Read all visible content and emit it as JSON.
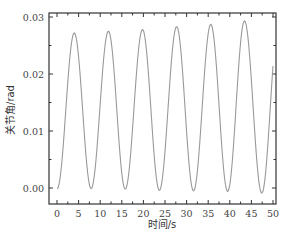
{
  "chart_data": {
    "type": "line",
    "title": "",
    "xlabel": "时间/s",
    "ylabel": "关节角/rad",
    "xlim": [
      -2,
      52
    ],
    "ylim": [
      -0.0028,
      0.0312
    ],
    "xticks": [
      0,
      5,
      10,
      15,
      20,
      25,
      30,
      35,
      40,
      45,
      50
    ],
    "xtick_labels": [
      "0",
      "5",
      "10",
      "15",
      "20",
      "25",
      "30",
      "35",
      "40",
      "45",
      "50"
    ],
    "yticks": [
      0.0,
      0.01,
      0.02,
      0.03
    ],
    "ytick_labels": [
      "0.00",
      "0.01",
      "0.02",
      "0.03"
    ],
    "grid": false,
    "legend": null,
    "line_color": "#999999",
    "series": [
      {
        "name": "关节角",
        "description": "sinusoidal oscillation with slowly growing amplitude, period ~7.8 s",
        "x": [
          0.0,
          4.0,
          7.9,
          11.9,
          15.8,
          19.8,
          23.7,
          27.7,
          31.6,
          35.6,
          39.5,
          43.4,
          47.4,
          50.0
        ],
        "y": [
          0.0,
          0.0272,
          -0.0001,
          0.0275,
          -0.0002,
          0.0278,
          -0.0004,
          0.0283,
          -0.0005,
          0.0287,
          -0.0006,
          0.0293,
          -0.0009,
          0.0209
        ]
      }
    ]
  },
  "labels": {
    "x_axis": "时间/s",
    "y_axis": "关节角/rad",
    "caption": "图 — 关节角随时间的变化"
  }
}
